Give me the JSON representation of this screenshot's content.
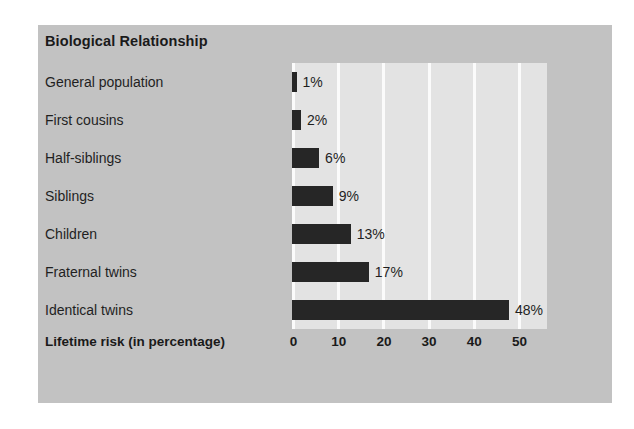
{
  "chart_data": {
    "type": "bar",
    "orientation": "horizontal",
    "title": "Biological Relationship",
    "xlabel": "Lifetime risk (in percentage)",
    "ylabel": "",
    "categories": [
      "General population",
      "First cousins",
      "Half-siblings",
      "Siblings",
      "Children",
      "Fraternal twins",
      "Identical twins"
    ],
    "values": [
      1,
      2,
      6,
      9,
      13,
      17,
      48
    ],
    "value_labels": [
      "1%",
      "2%",
      "6%",
      "9%",
      "13%",
      "17%",
      "48%"
    ],
    "xticks": [
      "0",
      "10",
      "20",
      "30",
      "40",
      "50"
    ],
    "xtick_values": [
      0,
      10,
      20,
      30,
      40,
      50
    ],
    "xlim": [
      0,
      56
    ],
    "grid": "vertical",
    "legend": "none",
    "colors": {
      "bar": "#262626",
      "panel_background": "#c2c2c2",
      "plot_background": "#e3e3e3",
      "gridline": "#fbfbfb",
      "text": "#1f1f1f"
    }
  }
}
